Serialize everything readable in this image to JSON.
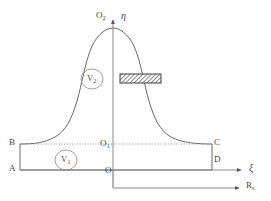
{
  "figure": {
    "type": "technical-diagram",
    "background_color": "#ffffff",
    "stroke_color": "#58585a",
    "text_color": "#4a4a4a",
    "hatch_color": "#6b6b6b",
    "width": 271,
    "height": 201
  },
  "axes": {
    "vertical": {
      "name": "eta-axis",
      "label": "η",
      "label_x": 121,
      "label_y": 12,
      "origin_label": "O₂"
    },
    "horizontal": {
      "name": "xi-axis",
      "label": "ξ",
      "label_x": 249,
      "label_y": 165,
      "origin_label": "O"
    },
    "secondary": {
      "name": "rs-axis",
      "label": "R",
      "sub": "s",
      "label_x": 247,
      "label_y": 183
    }
  },
  "points": [
    {
      "id": "O2",
      "label": "O",
      "sub": "2",
      "x": 95,
      "y": 16,
      "name": "point-o2"
    },
    {
      "id": "V2",
      "label": "V",
      "sub": "2",
      "x": 85,
      "y": 74,
      "name": "region-v2"
    },
    {
      "id": "B",
      "label": "B",
      "sub": "",
      "x": 10,
      "y": 139,
      "name": "point-b"
    },
    {
      "id": "C",
      "label": "C",
      "sub": "",
      "x": 214,
      "y": 139,
      "name": "point-c"
    },
    {
      "id": "O1",
      "label": "O",
      "sub": "1",
      "x": 100,
      "y": 140,
      "name": "point-o1"
    },
    {
      "id": "V1",
      "label": "V",
      "sub": "1",
      "x": 60,
      "y": 156,
      "name": "region-v1"
    },
    {
      "id": "D",
      "label": "D",
      "sub": "",
      "x": 214,
      "y": 157,
      "name": "point-d"
    },
    {
      "id": "A",
      "label": "A",
      "sub": "",
      "x": 10,
      "y": 165,
      "name": "point-a"
    },
    {
      "id": "O",
      "label": "O",
      "sub": "",
      "x": 104,
      "y": 167,
      "name": "point-o"
    }
  ],
  "regions": {
    "v1": {
      "label": "V",
      "sub": "1",
      "name": "volume-one"
    },
    "v2": {
      "label": "V",
      "sub": "2",
      "name": "volume-two"
    }
  },
  "geometry": {
    "curve_apex_x": 113,
    "curve_apex_y": 28,
    "box_left": 20,
    "box_right": 212,
    "box_top": 144,
    "box_bottom": 170,
    "hatch_rect": {
      "x": 120,
      "y": 74,
      "width": 41,
      "height": 9
    }
  }
}
